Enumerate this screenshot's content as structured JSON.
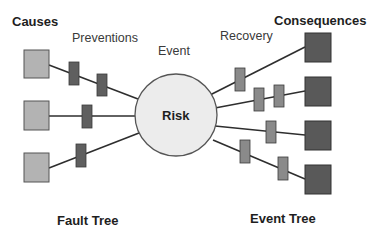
{
  "labels": {
    "causes": "Causes",
    "preventions": "Preventions",
    "event": "Event",
    "recovery": "Recovery",
    "consequences": "Consequences",
    "risk": "Risk",
    "fault_tree": "Fault Tree",
    "event_tree": "Event Tree"
  },
  "colors": {
    "background": "#ffffff",
    "cause_fill": "#b3b3b3",
    "cause_stroke": "#555555",
    "prevention_barrier_fill": "#5f5f5f",
    "recovery_barrier_fill": "#8a8a8a",
    "barrier_stroke": "#3a3a3a",
    "consequence_fill": "#595959",
    "consequence_stroke": "#333333",
    "risk_fill": "#ececec",
    "risk_stroke": "#555555",
    "line": "#2e2e2e"
  },
  "diagram": {
    "risk_node": {
      "cx": 176,
      "cy": 115,
      "r": 41
    },
    "causes": [
      {
        "id": "cause-1",
        "x": 24,
        "y": 50,
        "w": 25,
        "h": 28
      },
      {
        "id": "cause-2",
        "x": 24,
        "y": 101,
        "w": 25,
        "h": 29
      },
      {
        "id": "cause-3",
        "x": 24,
        "y": 153,
        "w": 25,
        "h": 29
      }
    ],
    "consequences": [
      {
        "id": "consequence-1",
        "x": 305,
        "y": 33,
        "w": 26,
        "h": 29
      },
      {
        "id": "consequence-2",
        "x": 305,
        "y": 77,
        "w": 26,
        "h": 29
      },
      {
        "id": "consequence-3",
        "x": 305,
        "y": 121,
        "w": 26,
        "h": 29
      },
      {
        "id": "consequence-4",
        "x": 305,
        "y": 165,
        "w": 26,
        "h": 29
      }
    ],
    "prevention_barriers": [
      {
        "x": 69,
        "y": 62,
        "w": 10,
        "h": 23
      },
      {
        "x": 97,
        "y": 74,
        "w": 10,
        "h": 22
      },
      {
        "x": 82,
        "y": 105,
        "w": 10,
        "h": 23
      },
      {
        "x": 76,
        "y": 144,
        "w": 10,
        "h": 23
      }
    ],
    "recovery_barriers": [
      {
        "x": 235,
        "y": 68,
        "w": 10,
        "h": 23
      },
      {
        "x": 254,
        "y": 88,
        "w": 10,
        "h": 23
      },
      {
        "x": 274,
        "y": 85,
        "w": 10,
        "h": 22
      },
      {
        "x": 266,
        "y": 121,
        "w": 10,
        "h": 22
      },
      {
        "x": 240,
        "y": 140,
        "w": 10,
        "h": 23
      },
      {
        "x": 278,
        "y": 157,
        "w": 10,
        "h": 23
      }
    ],
    "cause_links": [
      {
        "x1": 49,
        "y1": 65,
        "x2": 138,
        "y2": 99
      },
      {
        "x1": 49,
        "y1": 116,
        "x2": 137,
        "y2": 116
      },
      {
        "x1": 49,
        "y1": 168,
        "x2": 139,
        "y2": 133
      }
    ],
    "consequence_links": [
      {
        "x1": 210,
        "y1": 95,
        "x2": 305,
        "y2": 47
      },
      {
        "x1": 215,
        "y1": 108,
        "x2": 305,
        "y2": 91
      },
      {
        "x1": 215,
        "y1": 126,
        "x2": 305,
        "y2": 135
      },
      {
        "x1": 213,
        "y1": 140,
        "x2": 305,
        "y2": 179
      }
    ]
  }
}
